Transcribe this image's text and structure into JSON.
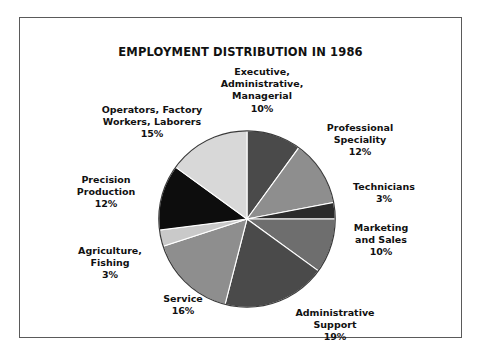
{
  "chart_data": {
    "type": "pie",
    "title": "EMPLOYMENT DISTRIBUTION IN 1986",
    "xlabel": "",
    "ylabel": "",
    "legend": "none",
    "grid": false,
    "units": "percent",
    "total": 100,
    "start_angle_deg": 0,
    "direction": "clockwise",
    "categories": [
      "Executive, Administrative, Managerial",
      "Professional Speciality",
      "Technicians",
      "Marketing and Sales",
      "Administrative Support",
      "Service",
      "Agriculture, Fishing",
      "Precision Production",
      "Operators, Factory Workers, Laborers"
    ],
    "values": [
      10,
      12,
      3,
      10,
      19,
      16,
      3,
      12,
      15
    ],
    "colors": [
      "#4a4a4a",
      "#8e8e8e",
      "#2b2b2b",
      "#6e6e6e",
      "#4a4a4a",
      "#8e8e8e",
      "#c9c9c9",
      "#0d0d0d",
      "#d8d8d8"
    ],
    "slices": [
      {
        "label": "Executive, Administrative, Managerial",
        "value": 10,
        "color": "#4a4a4a"
      },
      {
        "label": "Professional Speciality",
        "value": 12,
        "color": "#8e8e8e"
      },
      {
        "label": "Technicians",
        "value": 3,
        "color": "#2b2b2b"
      },
      {
        "label": "Marketing and Sales",
        "value": 10,
        "color": "#6e6e6e"
      },
      {
        "label": "Administrative Support",
        "value": 19,
        "color": "#4a4a4a"
      },
      {
        "label": "Service",
        "value": 16,
        "color": "#8e8e8e"
      },
      {
        "label": "Agriculture, Fishing",
        "value": 3,
        "color": "#c9c9c9"
      },
      {
        "label": "Precision Production",
        "value": 12,
        "color": "#0d0d0d"
      },
      {
        "label": "Operators, Factory Workers, Laborers",
        "value": 15,
        "color": "#d8d8d8"
      }
    ]
  },
  "chart": {
    "title": "EMPLOYMENT DISTRIBUTION IN 1986",
    "border_color": "#5a5a5a",
    "background": "#ffffff"
  },
  "labels": {
    "executive": {
      "line1": "Executive,",
      "line2": "Administrative,",
      "line3": "Managerial",
      "pct": "10%"
    },
    "professional": {
      "line1": "Professional",
      "line2": "Speciality",
      "pct": "12%"
    },
    "technicians": {
      "line1": "Technicians",
      "pct": "3%"
    },
    "marketing": {
      "line1": "Marketing",
      "line2": "and Sales",
      "pct": "10%"
    },
    "admin_support": {
      "line1": "Administrative",
      "line2": "Support",
      "pct": "19%"
    },
    "service": {
      "line1": "Service",
      "pct": "16%"
    },
    "agriculture": {
      "line1": "Agriculture,",
      "line2": "Fishing",
      "pct": "3%"
    },
    "precision": {
      "line1": "Precision",
      "line2": "Production",
      "pct": "12%"
    },
    "operators": {
      "line1": "Operators, Factory",
      "line2": "Workers, Laborers",
      "pct": "15%"
    }
  }
}
